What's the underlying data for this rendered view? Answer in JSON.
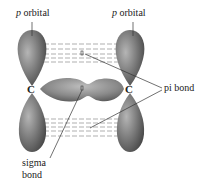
{
  "diagram": {
    "labels": {
      "p_orbital_left_italic": "p",
      "p_orbital_left_text": " orbital",
      "p_orbital_right_italic": "p",
      "p_orbital_right_text": " orbital",
      "pi_bond": "pi bond",
      "sigma_bond_line1": "sigma",
      "sigma_bond_line2": "bond",
      "carbon_left": "C",
      "carbon_right": "C"
    },
    "colors": {
      "lobe_dark": "#5a5a5a",
      "lobe_mid": "#8a8a8a",
      "lobe_light": "#b5b5b5",
      "dash": "#8c8c8c",
      "leader": "#333333"
    }
  }
}
